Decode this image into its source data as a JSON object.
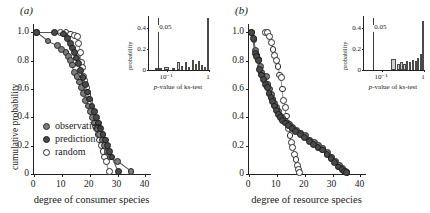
{
  "figure": {
    "panels": [
      {
        "label": "(a)",
        "xlabel": "degree of consumer species",
        "ylabel": "cumulative probability",
        "xticks": [
          "0",
          "10",
          "20",
          "30",
          "40"
        ],
        "yticks": [
          "0",
          "0.2",
          "0.4",
          "0.6",
          "0.8",
          "1.0"
        ],
        "legend": [
          {
            "name": "observation",
            "style": "filled-gray"
          },
          {
            "name": "prediction",
            "style": "filled-dark"
          },
          {
            "name": "random",
            "style": "open"
          }
        ],
        "inset": {
          "xlabel": "p-value of ks-test",
          "ylabel": "probability",
          "yticks": [
            "0",
            "0.2",
            "0.4"
          ],
          "xticks": [
            "10⁻¹",
            "1"
          ],
          "threshold_label": "0.05"
        }
      },
      {
        "label": "(b)",
        "xlabel": "degree of resource species",
        "ylabel": "cumulative probability",
        "xticks": [
          "0",
          "10",
          "20",
          "30",
          "40"
        ],
        "yticks": [
          "0",
          "0.2",
          "0.4",
          "0.6",
          "0.8",
          "1.0"
        ],
        "inset": {
          "xlabel": "p-value of ks-test",
          "ylabel": "probability",
          "yticks": [
            "0",
            "0.2",
            "0.4"
          ],
          "xticks": [
            "10⁻¹",
            "1"
          ],
          "threshold_label": "0.05"
        }
      }
    ]
  },
  "chart_data": [
    {
      "type": "scatter",
      "panel": "(a)",
      "title": "",
      "xlabel": "degree of consumer species",
      "ylabel": "cumulative probability",
      "xlim": [
        0,
        42
      ],
      "ylim": [
        0,
        1.06
      ],
      "xticks": [
        0,
        10,
        20,
        30,
        40
      ],
      "yticks": [
        0,
        0.2,
        0.4,
        0.6,
        0.8,
        1.0
      ],
      "grid": false,
      "legend_position": "lower-left",
      "series": [
        {
          "name": "observation",
          "marker": "filled-gray-circle",
          "color": "#7d7d7d",
          "points": [
            [
              1.0,
              1.0
            ],
            [
              5.0,
              0.94
            ],
            [
              8.5,
              0.91
            ],
            [
              10.0,
              0.88
            ],
            [
              11.5,
              0.86
            ],
            [
              12.3,
              0.83
            ],
            [
              13.0,
              0.8
            ],
            [
              13.8,
              0.77
            ],
            [
              14.6,
              0.72
            ],
            [
              15.4,
              0.69
            ],
            [
              16.2,
              0.65
            ],
            [
              17.0,
              0.61
            ],
            [
              17.8,
              0.57
            ],
            [
              18.6,
              0.52
            ],
            [
              19.4,
              0.48
            ],
            [
              20.2,
              0.44
            ],
            [
              21.0,
              0.4
            ],
            [
              21.8,
              0.36
            ],
            [
              22.6,
              0.32
            ],
            [
              23.4,
              0.28
            ],
            [
              24.4,
              0.24
            ],
            [
              25.4,
              0.2
            ],
            [
              26.4,
              0.16
            ],
            [
              27.4,
              0.12
            ],
            [
              30.0,
              0.09
            ],
            [
              34.8,
              0.02
            ]
          ]
        },
        {
          "name": "prediction",
          "marker": "filled-dark-circle",
          "color": "#4a4a4a",
          "points": [
            [
              1.0,
              1.0
            ],
            [
              7.5,
              1.0
            ],
            [
              10.5,
              0.99
            ],
            [
              12.0,
              0.96
            ],
            [
              13.0,
              0.92
            ],
            [
              13.8,
              0.89
            ],
            [
              14.5,
              0.86
            ],
            [
              15.2,
              0.82
            ],
            [
              16.0,
              0.78
            ],
            [
              16.8,
              0.73
            ],
            [
              17.6,
              0.68
            ],
            [
              18.4,
              0.63
            ],
            [
              19.2,
              0.58
            ],
            [
              20.0,
              0.53
            ],
            [
              20.8,
              0.48
            ],
            [
              21.6,
              0.44
            ],
            [
              22.4,
              0.4
            ],
            [
              23.2,
              0.36
            ],
            [
              24.0,
              0.32
            ],
            [
              24.8,
              0.28
            ],
            [
              25.6,
              0.24
            ],
            [
              26.4,
              0.2
            ],
            [
              27.2,
              0.16
            ],
            [
              28.0,
              0.12
            ],
            [
              30.2,
              0.02
            ]
          ]
        },
        {
          "name": "random",
          "marker": "open-circle",
          "color": "#ffffff",
          "points": [
            [
              9.5,
              1.0
            ],
            [
              11.5,
              1.0
            ],
            [
              13.0,
              0.99
            ],
            [
              14.5,
              0.98
            ],
            [
              15.5,
              0.97
            ],
            [
              16.0,
              0.92
            ],
            [
              16.6,
              0.86
            ],
            [
              17.0,
              0.79
            ],
            [
              17.4,
              0.75
            ],
            [
              17.8,
              0.69
            ],
            [
              18.2,
              0.66
            ],
            [
              18.8,
              0.61
            ],
            [
              19.4,
              0.56
            ],
            [
              20.0,
              0.51
            ],
            [
              20.6,
              0.46
            ],
            [
              21.2,
              0.41
            ],
            [
              21.8,
              0.36
            ],
            [
              22.4,
              0.32
            ],
            [
              23.0,
              0.28
            ],
            [
              23.6,
              0.24
            ],
            [
              24.2,
              0.2
            ],
            [
              24.8,
              0.16
            ],
            [
              25.4,
              0.12
            ],
            [
              26.0,
              0.09
            ],
            [
              27.0,
              0.02
            ]
          ]
        }
      ],
      "inset": {
        "type": "bar",
        "xlabel": "p-value of ks-test",
        "ylabel": "probability",
        "yticks": [
          0,
          0.2,
          0.4
        ],
        "ylim": [
          0,
          0.52
        ],
        "xticks_labels": [
          "10⁻¹",
          "1"
        ],
        "xscale": "log",
        "threshold_label": "0.05",
        "bars": [
          {
            "x": 0.1,
            "w": 0.115,
            "h": 0.022
          },
          {
            "x": 0.25,
            "w": 0.09,
            "h": 0.03
          },
          {
            "x": 0.38,
            "w": 0.048,
            "h": 0.022
          },
          {
            "x": 0.47,
            "w": 0.04,
            "h": 0.08
          },
          {
            "x": 0.535,
            "w": 0.04,
            "h": 0.04
          },
          {
            "x": 0.6,
            "w": 0.038,
            "h": 0.075
          },
          {
            "x": 0.655,
            "w": 0.035,
            "h": 0.028
          },
          {
            "x": 0.71,
            "w": 0.035,
            "h": 0.095
          },
          {
            "x": 0.765,
            "w": 0.033,
            "h": 0.06
          },
          {
            "x": 0.815,
            "w": 0.033,
            "h": 0.085
          },
          {
            "x": 0.868,
            "w": 0.032,
            "h": 0.05
          },
          {
            "x": 0.915,
            "w": 0.03,
            "h": 0.03
          },
          {
            "x": 0.965,
            "w": 0.035,
            "h": 0.5
          }
        ]
      }
    },
    {
      "type": "scatter",
      "panel": "(b)",
      "title": "",
      "xlabel": "degree of resource species",
      "ylabel": "cumulative probability",
      "xlim": [
        0,
        42
      ],
      "ylim": [
        0,
        1.06
      ],
      "xticks": [
        0,
        10,
        20,
        30,
        40
      ],
      "yticks": [
        0,
        0.2,
        0.4,
        0.6,
        0.8,
        1.0
      ],
      "grid": false,
      "legend_position": "none",
      "series": [
        {
          "name": "observation",
          "marker": "filled-gray-circle",
          "color": "#7d7d7d",
          "points": [
            [
              1.0,
              1.0
            ],
            [
              1.8,
              0.95
            ],
            [
              2.4,
              0.87
            ],
            [
              2.9,
              0.84
            ],
            [
              3.4,
              0.81
            ],
            [
              4.0,
              0.76
            ],
            [
              4.6,
              0.72
            ],
            [
              5.2,
              0.69
            ],
            [
              6.2,
              0.69
            ],
            [
              6.8,
              0.63
            ],
            [
              7.4,
              0.6
            ],
            [
              8.0,
              0.56
            ],
            [
              8.6,
              0.53
            ],
            [
              9.2,
              0.5
            ],
            [
              9.9,
              0.47
            ],
            [
              10.6,
              0.44
            ],
            [
              11.4,
              0.41
            ],
            [
              12.2,
              0.39
            ],
            [
              13.2,
              0.37
            ],
            [
              14.4,
              0.35
            ],
            [
              15.6,
              0.33
            ],
            [
              17.0,
              0.31
            ],
            [
              18.6,
              0.29
            ],
            [
              20.2,
              0.27
            ],
            [
              21.8,
              0.24
            ],
            [
              23.4,
              0.22
            ],
            [
              25.0,
              0.2
            ],
            [
              26.6,
              0.18
            ],
            [
              28.2,
              0.15
            ],
            [
              29.6,
              0.12
            ],
            [
              31.0,
              0.09
            ],
            [
              32.4,
              0.06
            ],
            [
              33.6,
              0.04
            ],
            [
              34.6,
              0.02
            ],
            [
              35.2,
              0.01
            ]
          ]
        },
        {
          "name": "prediction",
          "marker": "filled-dark-circle",
          "color": "#4a4a4a",
          "points": [
            [
              1.0,
              1.0
            ],
            [
              1.6,
              0.96
            ],
            [
              2.2,
              0.85
            ],
            [
              2.8,
              0.83
            ],
            [
              3.3,
              0.8
            ],
            [
              3.9,
              0.74
            ],
            [
              4.5,
              0.7
            ],
            [
              5.1,
              0.67
            ],
            [
              5.9,
              0.63
            ],
            [
              6.6,
              0.61
            ],
            [
              7.2,
              0.57
            ],
            [
              7.9,
              0.54
            ],
            [
              8.5,
              0.51
            ],
            [
              9.1,
              0.48
            ],
            [
              9.8,
              0.45
            ],
            [
              10.5,
              0.42
            ],
            [
              11.3,
              0.4
            ],
            [
              12.1,
              0.38
            ],
            [
              13.0,
              0.36
            ],
            [
              14.2,
              0.34
            ],
            [
              15.4,
              0.32
            ],
            [
              16.8,
              0.3
            ],
            [
              18.4,
              0.28
            ],
            [
              20.0,
              0.26
            ],
            [
              21.6,
              0.23
            ],
            [
              23.2,
              0.21
            ],
            [
              24.8,
              0.19
            ],
            [
              26.4,
              0.17
            ],
            [
              28.0,
              0.14
            ],
            [
              29.4,
              0.11
            ],
            [
              30.8,
              0.08
            ],
            [
              32.2,
              0.05
            ],
            [
              33.4,
              0.03
            ],
            [
              34.4,
              0.02
            ],
            [
              35.0,
              0.01
            ]
          ]
        },
        {
          "name": "random",
          "marker": "open-circle",
          "color": "#ffffff",
          "points": [
            [
              5.8,
              1.0
            ],
            [
              6.6,
              1.0
            ],
            [
              7.4,
              0.97
            ],
            [
              8.0,
              0.93
            ],
            [
              8.6,
              0.88
            ],
            [
              9.2,
              0.84
            ],
            [
              9.8,
              0.8
            ],
            [
              10.4,
              0.76
            ],
            [
              11.0,
              0.7
            ],
            [
              11.6,
              0.68
            ],
            [
              12.0,
              0.6
            ],
            [
              12.5,
              0.52
            ],
            [
              13.0,
              0.47
            ],
            [
              13.4,
              0.41
            ],
            [
              13.8,
              0.36
            ],
            [
              14.2,
              0.32
            ],
            [
              14.7,
              0.27
            ],
            [
              15.2,
              0.22
            ],
            [
              15.7,
              0.19
            ],
            [
              16.3,
              0.14
            ],
            [
              16.9,
              0.1
            ],
            [
              17.4,
              0.06
            ],
            [
              17.8,
              0.03
            ],
            [
              18.2,
              0.01
            ]
          ]
        }
      ],
      "inset": {
        "type": "bar",
        "xlabel": "p-value of ks-test",
        "ylabel": "probability",
        "yticks": [
          0,
          0.2,
          0.4
        ],
        "ylim": [
          0,
          0.52
        ],
        "xticks_labels": [
          "10⁻¹",
          "1"
        ],
        "xscale": "log",
        "threshold_label": "0.05",
        "bars": [
          {
            "x": 0.455,
            "w": 0.075,
            "h": 0.105
          },
          {
            "x": 0.545,
            "w": 0.048,
            "h": 0.055
          },
          {
            "x": 0.605,
            "w": 0.04,
            "h": 0.08
          },
          {
            "x": 0.655,
            "w": 0.038,
            "h": 0.06
          },
          {
            "x": 0.705,
            "w": 0.036,
            "h": 0.09
          },
          {
            "x": 0.755,
            "w": 0.034,
            "h": 0.075
          },
          {
            "x": 0.8,
            "w": 0.034,
            "h": 0.095
          },
          {
            "x": 0.845,
            "w": 0.032,
            "h": 0.085
          },
          {
            "x": 0.888,
            "w": 0.032,
            "h": 0.115
          },
          {
            "x": 0.93,
            "w": 0.03,
            "h": 0.15
          },
          {
            "x": 0.967,
            "w": 0.033,
            "h": 0.47
          }
        ]
      }
    }
  ]
}
